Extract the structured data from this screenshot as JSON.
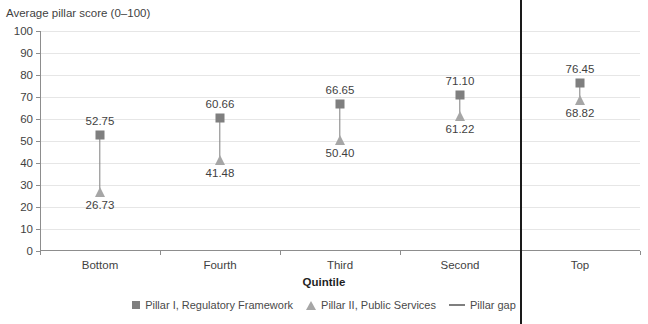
{
  "chart_data": {
    "type": "scatter",
    "title": "",
    "ylabel": "Average pillar score (0–100)",
    "xlabel": "Quintile",
    "ylim": [
      0,
      100
    ],
    "ytick_step": 10,
    "yticks": [
      100,
      90,
      80,
      70,
      60,
      50,
      40,
      30,
      20,
      10,
      0
    ],
    "grid": true,
    "legend_position": "bottom",
    "categories": [
      "Bottom",
      "Fourth",
      "Third",
      "Second",
      "Top"
    ],
    "series": [
      {
        "name": "Pillar I, Regulatory Framework",
        "marker": "square",
        "color": "#7f7f7f",
        "values": [
          52.75,
          60.66,
          66.65,
          71.1,
          76.45
        ],
        "labels": [
          "52.75",
          "60.66",
          "66.65",
          "71.10",
          "76.45"
        ]
      },
      {
        "name": "Pillar II, Public Services",
        "marker": "triangle",
        "color": "#a6a6a6",
        "values": [
          26.73,
          41.48,
          50.4,
          61.22,
          68.82
        ],
        "labels": [
          "26.73",
          "41.48",
          "50.40",
          "61.22",
          "68.82"
        ]
      },
      {
        "name": "Pillar gap",
        "marker": "line",
        "color": "#7f7f7f",
        "values": [
          26.02,
          19.18,
          16.25,
          9.88,
          7.63
        ]
      }
    ],
    "annotations": [
      {
        "type": "vertical-divider",
        "after_category": "Second",
        "color": "#1a1a1a"
      }
    ]
  },
  "legend": {
    "items": [
      {
        "label": "Pillar I, Regulatory Framework"
      },
      {
        "label": "Pillar II, Public Services"
      },
      {
        "label": "Pillar gap"
      }
    ]
  },
  "colors": {
    "pillar_one": "#7f7f7f",
    "pillar_two": "#a6a6a6",
    "gap_line": "#7f7f7f",
    "divider": "#1a1a1a",
    "gridline": "#e6e6e6",
    "axis": "#8d8d8d",
    "text": "#3f3f3f"
  }
}
